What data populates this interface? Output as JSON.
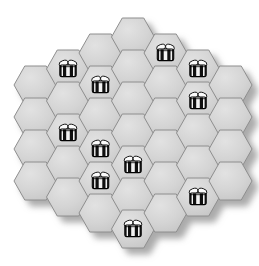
{
  "board": {
    "name": "hexagonal-honeycomb-board",
    "shape": "hexagon",
    "orientation": "pointy-top",
    "columns": 7,
    "column_counts": [
      4,
      5,
      6,
      7,
      6,
      5,
      4
    ],
    "total_cells": 37,
    "cell_width": 43,
    "cell_height": 38,
    "col_step": 32.5,
    "row_step": 32.0,
    "origin_x": 14,
    "origin_y": 18,
    "colors": {
      "cell_fill": "#cfcfcf",
      "cell_fill_light": "#dedede",
      "cell_stroke": "#8e8e8e",
      "cell_highlight": "#e8e8e8",
      "background": "#ffffff",
      "shadow": "#b8b8b8"
    },
    "shadow": {
      "offset_x": 7,
      "offset_y": 7,
      "blur": 6,
      "color": "#9a9a9a"
    }
  },
  "bee": {
    "name": "bee-token",
    "label": "bee",
    "width": 21,
    "height": 16,
    "colors": {
      "body_stripe_dark": "#111111",
      "body_stripe_light": "#f4f4f4",
      "wing_fill": "#fcfcfc",
      "wing_stroke": "#1a1a1a",
      "outline": "#000000",
      "head": "#f4f4f4"
    },
    "stripe_count": 3
  },
  "cells": [
    {
      "id": "c0r0",
      "col": 0,
      "row": 0,
      "cx": 35.5,
      "cy": 85.0,
      "bee": false
    },
    {
      "id": "c0r1",
      "col": 0,
      "row": 1,
      "cx": 35.5,
      "cy": 117.0,
      "bee": false
    },
    {
      "id": "c0r2",
      "col": 0,
      "row": 2,
      "cx": 35.5,
      "cy": 149.0,
      "bee": false
    },
    {
      "id": "c0r3",
      "col": 0,
      "row": 3,
      "cx": 35.5,
      "cy": 181.0,
      "bee": false
    },
    {
      "id": "c1r0",
      "col": 1,
      "row": 0,
      "cx": 68.0,
      "cy": 69.0,
      "bee": true
    },
    {
      "id": "c1r1",
      "col": 1,
      "row": 1,
      "cx": 68.0,
      "cy": 101.0,
      "bee": false
    },
    {
      "id": "c1r2",
      "col": 1,
      "row": 2,
      "cx": 68.0,
      "cy": 133.0,
      "bee": true
    },
    {
      "id": "c1r3",
      "col": 1,
      "row": 3,
      "cx": 68.0,
      "cy": 165.0,
      "bee": false
    },
    {
      "id": "c1r4",
      "col": 1,
      "row": 4,
      "cx": 68.0,
      "cy": 197.0,
      "bee": false
    },
    {
      "id": "c2r0",
      "col": 2,
      "row": 0,
      "cx": 100.5,
      "cy": 53.0,
      "bee": false
    },
    {
      "id": "c2r1",
      "col": 2,
      "row": 1,
      "cx": 100.5,
      "cy": 85.0,
      "bee": true
    },
    {
      "id": "c2r2",
      "col": 2,
      "row": 2,
      "cx": 100.5,
      "cy": 117.0,
      "bee": false
    },
    {
      "id": "c2r3",
      "col": 2,
      "row": 3,
      "cx": 100.5,
      "cy": 149.0,
      "bee": true
    },
    {
      "id": "c2r4",
      "col": 2,
      "row": 4,
      "cx": 100.5,
      "cy": 181.0,
      "bee": true
    },
    {
      "id": "c2r5",
      "col": 2,
      "row": 5,
      "cx": 100.5,
      "cy": 213.0,
      "bee": false
    },
    {
      "id": "c3r0",
      "col": 3,
      "row": 0,
      "cx": 133.0,
      "cy": 37.0,
      "bee": false
    },
    {
      "id": "c3r1",
      "col": 3,
      "row": 1,
      "cx": 133.0,
      "cy": 69.0,
      "bee": false
    },
    {
      "id": "c3r2",
      "col": 3,
      "row": 2,
      "cx": 133.0,
      "cy": 101.0,
      "bee": false
    },
    {
      "id": "c3r3",
      "col": 3,
      "row": 3,
      "cx": 133.0,
      "cy": 133.0,
      "bee": false
    },
    {
      "id": "c3r4",
      "col": 3,
      "row": 4,
      "cx": 133.0,
      "cy": 165.0,
      "bee": true
    },
    {
      "id": "c3r5",
      "col": 3,
      "row": 5,
      "cx": 133.0,
      "cy": 197.0,
      "bee": false
    },
    {
      "id": "c3r6",
      "col": 3,
      "row": 6,
      "cx": 133.0,
      "cy": 229.0,
      "bee": true
    },
    {
      "id": "c4r0",
      "col": 4,
      "row": 0,
      "cx": 165.5,
      "cy": 53.0,
      "bee": true
    },
    {
      "id": "c4r1",
      "col": 4,
      "row": 1,
      "cx": 165.5,
      "cy": 85.0,
      "bee": false
    },
    {
      "id": "c4r2",
      "col": 4,
      "row": 2,
      "cx": 165.5,
      "cy": 117.0,
      "bee": false
    },
    {
      "id": "c4r3",
      "col": 4,
      "row": 3,
      "cx": 165.5,
      "cy": 149.0,
      "bee": false
    },
    {
      "id": "c4r4",
      "col": 4,
      "row": 4,
      "cx": 165.5,
      "cy": 181.0,
      "bee": false
    },
    {
      "id": "c4r5",
      "col": 4,
      "row": 5,
      "cx": 165.5,
      "cy": 213.0,
      "bee": false
    },
    {
      "id": "c5r0",
      "col": 5,
      "row": 0,
      "cx": 198.0,
      "cy": 69.0,
      "bee": true
    },
    {
      "id": "c5r1",
      "col": 5,
      "row": 1,
      "cx": 198.0,
      "cy": 101.0,
      "bee": true
    },
    {
      "id": "c5r2",
      "col": 5,
      "row": 2,
      "cx": 198.0,
      "cy": 133.0,
      "bee": false
    },
    {
      "id": "c5r3",
      "col": 5,
      "row": 3,
      "cx": 198.0,
      "cy": 165.0,
      "bee": false
    },
    {
      "id": "c5r4",
      "col": 5,
      "row": 4,
      "cx": 198.0,
      "cy": 197.0,
      "bee": true
    },
    {
      "id": "c6r0",
      "col": 6,
      "row": 0,
      "cx": 230.5,
      "cy": 85.0,
      "bee": false
    },
    {
      "id": "c6r1",
      "col": 6,
      "row": 1,
      "cx": 230.5,
      "cy": 117.0,
      "bee": false
    },
    {
      "id": "c6r2",
      "col": 6,
      "row": 2,
      "cx": 230.5,
      "cy": 149.0,
      "bee": false
    },
    {
      "id": "c6r3",
      "col": 6,
      "row": 3,
      "cx": 230.5,
      "cy": 181.0,
      "bee": false
    }
  ],
  "bee_count": 11
}
